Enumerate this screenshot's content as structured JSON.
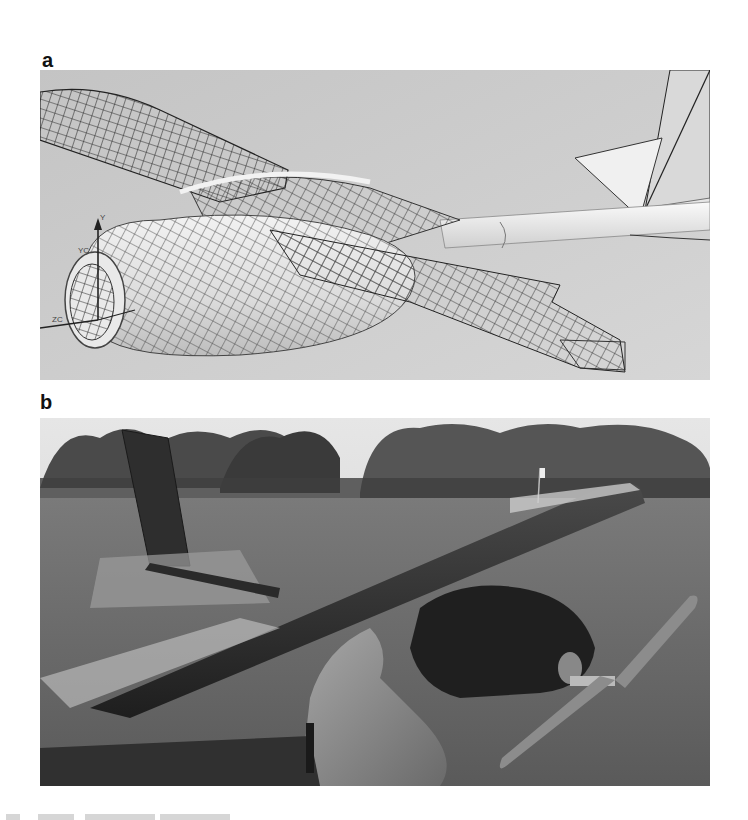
{
  "figure": {
    "panels": [
      {
        "label": "a",
        "type": "cad-render",
        "description": "3D CAD model of a small UAV with wireframe mesh on wings and fuselage pod, tail boom and vertical/horizontal stabilizers",
        "axis_labels": [
          "Y",
          "YC",
          "ZC"
        ]
      },
      {
        "label": "b",
        "type": "photograph",
        "description": "Photograph of the built UAV prototype held in hand over a grass field with trees in the background; dark wing, fuselage pod and propeller"
      }
    ],
    "colors": {
      "cad_background": "#c9c9c9",
      "mesh_lines": "#2a2a2a",
      "surface": "#e8e8e8",
      "grass": "#6e6e6e",
      "trees": "#3e3e3e",
      "sky": "#dcdcdc",
      "aircraft": "#2b2b2b"
    }
  }
}
